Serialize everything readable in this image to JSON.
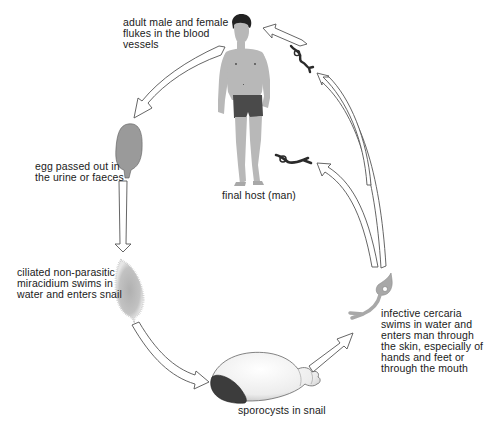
{
  "stages": [
    {
      "id": "adult",
      "label": "adult male and female flukes in the blood vessels"
    },
    {
      "id": "egg",
      "label": "egg passed out in the urine or faeces"
    },
    {
      "id": "miracidium",
      "label": "ciliated non-parasitic miracidium swims in water and enters snail"
    },
    {
      "id": "sporocyst",
      "label": "sporocysts in snail"
    },
    {
      "id": "cercaria",
      "label": "infective cercaria swims in water and enters man through the skin, especially of hands and feet or through the mouth"
    },
    {
      "id": "host",
      "label": "final host (man)"
    }
  ],
  "labels": {
    "adult_lines": [
      "adult male and female",
      "flukes in the blood",
      "vessels"
    ],
    "egg_lines": [
      "egg passed out in",
      "the urine or faeces"
    ],
    "mira_lines": [
      "ciliated non-parasitic",
      "miracidium swims in",
      "water and enters snail"
    ],
    "spor": "sporocysts in snail",
    "cerc_lines": [
      "infective cercaria",
      "swims in water and",
      "enters man through",
      "the skin, especially of",
      "hands and feet or",
      "through the mouth"
    ],
    "host": "final host (man)"
  },
  "flow": [
    "adult",
    "egg",
    "miracidium",
    "sporocyst",
    "cercaria",
    "host"
  ],
  "colors": {
    "arrow_stroke": "#555555",
    "arrow_fill": "#ffffff",
    "egg_fill": "#9a9a9a",
    "skin": "#b8b8b8",
    "shorts": "#4a4a4a",
    "hair": "#222222",
    "worm": "#2a2a2a",
    "cercaria": "#a8a8a8",
    "miracidium": "#b5b5b5",
    "shell": "#f2f2f2",
    "shell_opening": "#3c3c3c"
  }
}
